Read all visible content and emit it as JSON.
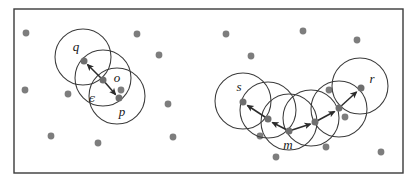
{
  "figure": {
    "background_color": "#ffffff",
    "frame": {
      "x": 14,
      "y": 9,
      "width": 389,
      "height": 164,
      "stroke_color": "#3a3a3a"
    },
    "colors": {
      "point_gray": "#7d7d7d",
      "core_point_gray": "#6e6e6e",
      "circle_stroke": "#3c3c3c",
      "arrow_stroke": "#2b2b2b",
      "label_color": "#181818"
    },
    "point_radius_px": 3.4,
    "epsilon_radius_px": 28
  },
  "labels": {
    "q": "q",
    "o": "o",
    "p": "p",
    "epsilon": "ϵ",
    "s": "s",
    "m": "m",
    "r": "r"
  },
  "left_cluster": {
    "caption": "density-reachable chain q <- o -> p",
    "epsilon_circles": [
      {
        "name": "circle-q",
        "cx": 83,
        "cy": 57,
        "r": 28
      },
      {
        "name": "circle-o",
        "cx": 103,
        "cy": 78,
        "r": 28
      },
      {
        "name": "circle-p",
        "cx": 117,
        "cy": 96,
        "r": 28
      }
    ],
    "core_points": [
      {
        "name": "point-q",
        "x": 84,
        "y": 61,
        "label": "q",
        "label_x": 76,
        "label_y": 48
      },
      {
        "name": "point-o",
        "x": 103,
        "y": 80,
        "label": "o",
        "label_x": 117,
        "label_y": 79
      },
      {
        "name": "point-p",
        "x": 119,
        "y": 98,
        "label": "p",
        "label_y": 113,
        "label_x": 122
      }
    ],
    "arrows": [
      {
        "name": "arrow-o-to-q",
        "x1": 103,
        "y1": 80,
        "x2": 85.5,
        "y2": 62.5
      },
      {
        "name": "arrow-o-to-p",
        "x1": 103,
        "y1": 80,
        "x2": 117.5,
        "y2": 96.5
      }
    ],
    "epsilon_marker": {
      "x": 92,
      "y": 99
    }
  },
  "right_cluster": {
    "caption": "density-connected points s and r via core point m",
    "epsilon_circles": [
      {
        "name": "circle-s-outer",
        "cx": 243,
        "cy": 101,
        "r": 28
      },
      {
        "name": "circle-s",
        "cx": 268,
        "cy": 110,
        "r": 28
      },
      {
        "name": "circle-m",
        "cx": 289,
        "cy": 122,
        "r": 28
      },
      {
        "name": "circle-mid",
        "cx": 311,
        "cy": 118,
        "r": 28
      },
      {
        "name": "circle-right",
        "cx": 339,
        "cy": 109,
        "r": 28
      },
      {
        "name": "circle-r",
        "cx": 360,
        "cy": 86,
        "r": 28
      }
    ],
    "core_points": [
      {
        "name": "point-s",
        "x": 243,
        "y": 102,
        "label": "s",
        "label_x": 239,
        "label_y": 88
      },
      {
        "name": "point-chain-1",
        "x": 268,
        "y": 119
      },
      {
        "name": "point-m",
        "x": 289,
        "y": 131,
        "label": "m",
        "label_x": 288,
        "label_y": 146
      },
      {
        "name": "point-chain-3",
        "x": 315,
        "y": 122
      },
      {
        "name": "point-chain-4",
        "x": 339,
        "y": 108
      },
      {
        "name": "point-r",
        "x": 361,
        "y": 88,
        "label": "r",
        "label_x": 372,
        "label_y": 80
      }
    ],
    "arrows": [
      {
        "name": "arrow-chain1-to-s",
        "x1": 268,
        "y1": 119,
        "x2": 245.5,
        "y2": 104.5
      },
      {
        "name": "arrow-m-to-chain1",
        "x1": 289,
        "y1": 131,
        "x2": 270.5,
        "y2": 121.5
      },
      {
        "name": "arrow-m-to-chain3",
        "x1": 289,
        "y1": 131,
        "x2": 312.5,
        "y2": 123.5
      },
      {
        "name": "arrow-chain3-to-chain4",
        "x1": 315,
        "y1": 122,
        "x2": 336.5,
        "y2": 110.5
      },
      {
        "name": "arrow-chain4-to-r",
        "x1": 339,
        "y1": 108,
        "x2": 358.5,
        "y2": 90.5
      }
    ]
  },
  "noise_points": [
    {
      "name": "noise-dot-1",
      "x": 26,
      "y": 33
    },
    {
      "name": "noise-dot-2",
      "x": 137,
      "y": 34
    },
    {
      "name": "noise-dot-3",
      "x": 159,
      "y": 55
    },
    {
      "name": "noise-dot-4",
      "x": 25,
      "y": 90
    },
    {
      "name": "noise-dot-5",
      "x": 68,
      "y": 94
    },
    {
      "name": "noise-dot-6",
      "x": 121,
      "y": 90
    },
    {
      "name": "noise-dot-7",
      "x": 168,
      "y": 104
    },
    {
      "name": "noise-dot-8",
      "x": 51,
      "y": 136
    },
    {
      "name": "noise-dot-9",
      "x": 98,
      "y": 143
    },
    {
      "name": "noise-dot-10",
      "x": 173,
      "y": 137
    },
    {
      "name": "noise-dot-11",
      "x": 226,
      "y": 34
    },
    {
      "name": "noise-dot-12",
      "x": 251,
      "y": 56
    },
    {
      "name": "noise-dot-13",
      "x": 303,
      "y": 31
    },
    {
      "name": "noise-dot-14",
      "x": 357,
      "y": 40
    },
    {
      "name": "noise-dot-15",
      "x": 260,
      "y": 136
    },
    {
      "name": "noise-dot-16",
      "x": 329,
      "y": 90
    },
    {
      "name": "noise-dot-17",
      "x": 326,
      "y": 147
    },
    {
      "name": "noise-dot-18",
      "x": 276,
      "y": 157
    },
    {
      "name": "noise-dot-19",
      "x": 381,
      "y": 152
    },
    {
      "name": "noise-dot-20",
      "x": 345,
      "y": 117
    }
  ]
}
